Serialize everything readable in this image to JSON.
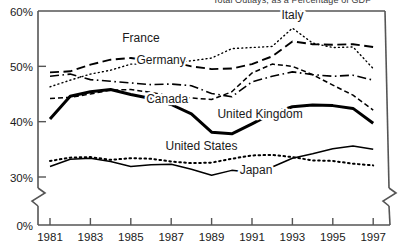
{
  "title_clipped": "Total Outlays, as a Percentage of GDP",
  "axes": {
    "y_ticks": [
      "60%",
      "50%",
      "40%",
      "30%",
      "0%"
    ],
    "y_tick_values": [
      60,
      50,
      40,
      30,
      0
    ],
    "x_ticks": [
      "1981",
      "1983",
      "1985",
      "1987",
      "1989",
      "1991",
      "1993",
      "1995",
      "1997"
    ],
    "axis_break": true,
    "colors": {
      "axis": "#555555",
      "line": "#000000",
      "text": "#1a1a1a"
    }
  },
  "labels": {
    "italy": "Italy",
    "france": "France",
    "germany": "Germany",
    "canada": "Canada",
    "united_kingdom": "United Kingdom",
    "united_states": "United States",
    "japan": "Japan"
  },
  "chart_data": {
    "type": "line",
    "title": "Total Outlays, as a Percentage of GDP",
    "xlabel": "",
    "ylabel": "",
    "xlim": [
      1981,
      1997
    ],
    "ylim": [
      28,
      60
    ],
    "ytick_labels": [
      "60%",
      "50%",
      "40%",
      "30%",
      "0%"
    ],
    "grid": false,
    "legend": "inline-annotations",
    "x": [
      1981,
      1982,
      1983,
      1984,
      1985,
      1986,
      1987,
      1988,
      1989,
      1990,
      1991,
      1992,
      1993,
      1994,
      1995,
      1996,
      1997
    ],
    "series": [
      {
        "name": "Italy",
        "style": "dotted",
        "width": 1.4,
        "label_x": 1993.0,
        "label_y": 58.6,
        "values": [
          46.3,
          47.5,
          48.6,
          49.3,
          50.4,
          50.4,
          50.6,
          51.0,
          51.5,
          53.2,
          53.4,
          53.6,
          56.9,
          54.2,
          53.4,
          53.5,
          49.6
        ]
      },
      {
        "name": "France",
        "style": "long-dash",
        "width": 1.9,
        "label_x": 1985.5,
        "label_y": 54.4,
        "values": [
          48.9,
          49.1,
          50.3,
          51.2,
          51.5,
          51.0,
          50.8,
          50.0,
          49.5,
          49.6,
          50.4,
          51.8,
          54.5,
          54.0,
          53.9,
          54.0,
          53.5
        ]
      },
      {
        "name": "Germany",
        "style": "dash-dot",
        "width": 1.6,
        "label_x": 1986.5,
        "label_y": 50.4,
        "values": [
          48.2,
          48.6,
          47.6,
          47.3,
          47.0,
          46.7,
          46.8,
          46.5,
          45.1,
          44.5,
          47.2,
          48.2,
          49.0,
          48.5,
          48.2,
          48.4,
          47.5
        ]
      },
      {
        "name": "Canada",
        "style": "short-dash",
        "width": 1.5,
        "label_x": 1986.8,
        "label_y": 43.4,
        "values": [
          44.2,
          44.4,
          45.0,
          45.7,
          45.8,
          45.3,
          44.6,
          44.3,
          44.0,
          45.4,
          48.8,
          50.4,
          50.0,
          48.5,
          46.6,
          44.8,
          42.1
        ]
      },
      {
        "name": "United Kingdom",
        "style": "thick-solid",
        "width": 3.0,
        "label_x": 1991.4,
        "label_y": 40.6,
        "values": [
          40.5,
          44.6,
          45.4,
          45.8,
          44.9,
          44.2,
          43.1,
          41.4,
          38.1,
          37.8,
          39.6,
          41.5,
          42.7,
          43.0,
          42.9,
          42.4,
          39.7
        ]
      },
      {
        "name": "United States",
        "style": "dotted-heavy",
        "width": 2.0,
        "label_x": 1988.5,
        "label_y": 34.8,
        "values": [
          32.9,
          33.5,
          33.6,
          33.1,
          33.4,
          33.3,
          32.8,
          32.5,
          32.6,
          33.3,
          33.9,
          34.0,
          33.6,
          33.0,
          32.9,
          32.4,
          32.1
        ]
      },
      {
        "name": "Japan",
        "style": "thin-solid",
        "width": 1.5,
        "label_x": 1991.2,
        "label_y": 30.6,
        "values": [
          31.9,
          33.2,
          33.4,
          32.8,
          31.9,
          32.2,
          32.3,
          31.4,
          30.3,
          31.2,
          30.8,
          31.8,
          33.4,
          34.2,
          35.1,
          35.6,
          35.0
        ]
      }
    ]
  }
}
